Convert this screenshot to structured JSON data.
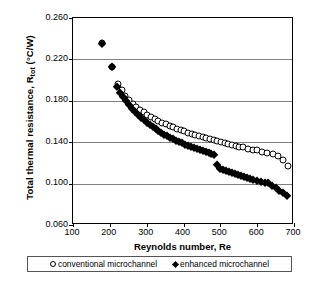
{
  "chart_data": {
    "type": "scatter",
    "title": "",
    "xlabel": "Reynolds number, Re",
    "ylabel": "Total thermal resistance, R",
    "ylabel_sub": "tot",
    "ylabel_units": " (°C/W)",
    "xlim": [
      100,
      700
    ],
    "ylim": [
      0.06,
      0.26
    ],
    "xticks": [
      100,
      200,
      300,
      400,
      500,
      600,
      700
    ],
    "yticks": [
      "0.060",
      "0.100",
      "0.140",
      "0.180",
      "0.220",
      "0.260"
    ],
    "ytick_values": [
      0.06,
      0.1,
      0.14,
      0.18,
      0.22,
      0.26
    ],
    "grid": "horizontal",
    "legend_position": "bottom",
    "series": [
      {
        "name": "conventional microchannel",
        "marker": "open-circle",
        "color": "#000000",
        "x": [
          180,
          205,
          222,
          232,
          242,
          252,
          262,
          272,
          282,
          292,
          302,
          312,
          322,
          332,
          342,
          352,
          362,
          372,
          382,
          392,
          402,
          412,
          422,
          432,
          442,
          452,
          462,
          472,
          482,
          492,
          502,
          512,
          522,
          532,
          542,
          552,
          562,
          575,
          588,
          600,
          614,
          628,
          642,
          656,
          670,
          684
        ],
        "y": [
          0.2355,
          0.213,
          0.196,
          0.19,
          0.185,
          0.1805,
          0.177,
          0.174,
          0.1712,
          0.1688,
          0.1665,
          0.1645,
          0.1625,
          0.1608,
          0.159,
          0.1575,
          0.1558,
          0.1544,
          0.153,
          0.1517,
          0.1504,
          0.1492,
          0.148,
          0.1469,
          0.1458,
          0.1447,
          0.1437,
          0.1427,
          0.1417,
          0.1408,
          0.1399,
          0.139,
          0.1381,
          0.1373,
          0.1365,
          0.1357,
          0.1349,
          0.1339,
          0.1329,
          0.132,
          0.1309,
          0.1298,
          0.1288,
          0.1267,
          0.123,
          0.1172
        ]
      },
      {
        "name": "enhanced microchannel",
        "marker": "filled-diamond",
        "color": "#000000",
        "x": [
          180,
          205,
          220,
          228,
          236,
          244,
          252,
          260,
          268,
          276,
          284,
          292,
          300,
          308,
          316,
          324,
          332,
          340,
          348,
          356,
          364,
          372,
          380,
          388,
          396,
          404,
          412,
          420,
          428,
          436,
          444,
          452,
          460,
          468,
          476,
          484,
          492,
          500,
          508,
          516,
          524,
          532,
          540,
          548,
          556,
          564,
          572,
          580,
          590,
          600,
          610,
          620,
          630,
          640,
          650,
          660,
          670,
          680
        ],
        "y": [
          0.2348,
          0.2124,
          0.193,
          0.188,
          0.1835,
          0.1795,
          0.1758,
          0.1724,
          0.1692,
          0.1663,
          0.1636,
          0.1611,
          0.1588,
          0.1566,
          0.1545,
          0.1526,
          0.1508,
          0.149,
          0.1474,
          0.1458,
          0.1443,
          0.1429,
          0.1415,
          0.1402,
          0.1389,
          0.1377,
          0.1366,
          0.1354,
          0.1344,
          0.1333,
          0.1323,
          0.1314,
          0.1304,
          0.1295,
          0.1287,
          0.1278,
          0.118,
          0.114,
          0.1128,
          0.1118,
          0.1108,
          0.1098,
          0.1089,
          0.108,
          0.1071,
          0.1063,
          0.1055,
          0.1047,
          0.1037,
          0.1028,
          0.1019,
          0.101,
          0.1001,
          0.0981,
          0.0955,
          0.093,
          0.0905,
          0.0885
        ]
      }
    ]
  },
  "legend": {
    "items": [
      {
        "label": "conventional microchannel",
        "marker": "open-circle"
      },
      {
        "label": "enhanced microchannel",
        "marker": "filled-diamond"
      }
    ]
  }
}
